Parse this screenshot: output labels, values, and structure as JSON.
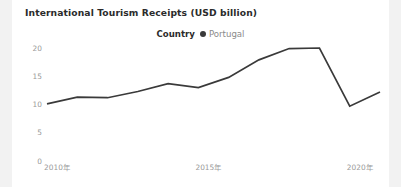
{
  "chart_data": {
    "type": "line",
    "title": "International Tourism Receipts (USD billion)",
    "xlabel": "",
    "ylabel": "",
    "legend_title": "Country",
    "legend_position": "top-center",
    "grid": false,
    "marker": "circle",
    "line_color": "#3a3a3a",
    "x": [
      2010,
      2011,
      2012,
      2013,
      2014,
      2015,
      2016,
      2017,
      2018,
      2019,
      2020,
      2021
    ],
    "categories": [
      "2010",
      "2011",
      "2012",
      "2013",
      "2014",
      "2015",
      "2016",
      "2017",
      "2018",
      "2019",
      "2020",
      "2021"
    ],
    "series": [
      {
        "name": "Portugal",
        "values": [
          10.1,
          11.3,
          11.2,
          12.3,
          13.7,
          13.0,
          14.8,
          17.9,
          19.9,
          20.0,
          9.7,
          12.2
        ]
      }
    ],
    "xlim": [
      2010,
      2021
    ],
    "ylim": [
      0,
      22
    ],
    "yticks": [
      0,
      5,
      10,
      15,
      20
    ],
    "ytick_labels": [
      "0",
      "5",
      "10",
      "15",
      "20"
    ],
    "xticks": [
      2010,
      2015,
      2020
    ],
    "xtick_labels": [
      "2010年",
      "2015年",
      "2020年"
    ]
  },
  "legend": {
    "title": "Country",
    "entries": [
      {
        "label": "Portugal",
        "color": "#3a3a3a",
        "marker": "circle"
      }
    ]
  }
}
